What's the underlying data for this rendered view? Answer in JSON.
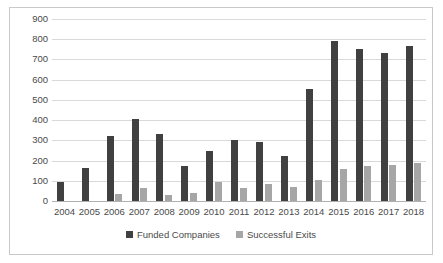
{
  "chart_data": {
    "type": "bar",
    "title": "",
    "xlabel": "",
    "ylabel": "",
    "ylim": [
      0,
      900
    ],
    "ytick_step": 100,
    "grid": true,
    "legend_position": "bottom",
    "categories": [
      "2004",
      "2005",
      "2006",
      "2007",
      "2008",
      "2009",
      "2010",
      "2011",
      "2012",
      "2013",
      "2014",
      "2015",
      "2016",
      "2017",
      "2018"
    ],
    "yticks": [
      "0",
      "100",
      "200",
      "300",
      "400",
      "500",
      "600",
      "700",
      "800",
      "900"
    ],
    "series": [
      {
        "name": "Funded Companies",
        "color": "#404040",
        "values": [
          95,
          165,
          320,
          405,
          330,
          175,
          245,
          300,
          290,
          225,
          555,
          790,
          750,
          730,
          765
        ]
      },
      {
        "name": "Successful Exits",
        "color": "#a6a6a6",
        "values": [
          0,
          0,
          35,
          65,
          30,
          40,
          95,
          65,
          85,
          70,
          105,
          160,
          175,
          180,
          190
        ]
      }
    ]
  },
  "legend": {
    "items": [
      {
        "label": "Funded Companies"
      },
      {
        "label": "Successful Exits"
      }
    ]
  }
}
